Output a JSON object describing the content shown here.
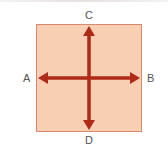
{
  "diagram": {
    "labels": {
      "left": "A",
      "right": "B",
      "top": "C",
      "bottom": "D"
    },
    "colors": {
      "square_fill": "#f9cfb3",
      "square_border": "#d58a6c",
      "arrow": "#b02a18",
      "label": "#555555"
    }
  }
}
